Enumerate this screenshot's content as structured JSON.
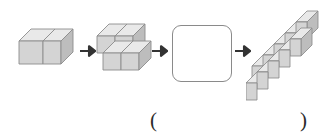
{
  "puzzle": {
    "type": "cube-sequence-pattern",
    "orientation": "horizontal",
    "answer_blank_index": 3,
    "steps": [
      {
        "index": 1,
        "name": "figure-1",
        "cube_count": 2,
        "description": "two cubes in a single row",
        "is_blank": false
      },
      {
        "index": 2,
        "name": "figure-2",
        "cube_count": 4,
        "description": "four cubes in a two-step staircase",
        "is_blank": false
      },
      {
        "index": 3,
        "name": "figure-3-blank",
        "cube_count": null,
        "description": "empty answer box",
        "is_blank": true
      },
      {
        "index": 4,
        "name": "figure-4",
        "cube_count": 10,
        "description": "ten cubes in a five-step staircase",
        "is_blank": false
      }
    ],
    "arrows": [
      {
        "name": "arrow-1",
        "glyph": "right-arrow"
      },
      {
        "name": "arrow-2",
        "glyph": "right-arrow"
      },
      {
        "name": "arrow-3",
        "glyph": "right-arrow"
      }
    ],
    "answer_field": {
      "open_paren": "(",
      "close_paren": ")",
      "value": ""
    }
  },
  "colors": {
    "cube_top": "#e9e9e9",
    "cube_front": "#d4d4d4",
    "cube_side": "#bdbdbd",
    "cube_stroke": "#8c8c8c",
    "arrow": "#333333",
    "box_border": "#8a8a8a",
    "paren": "#2b2b2b",
    "background": "#ffffff"
  }
}
